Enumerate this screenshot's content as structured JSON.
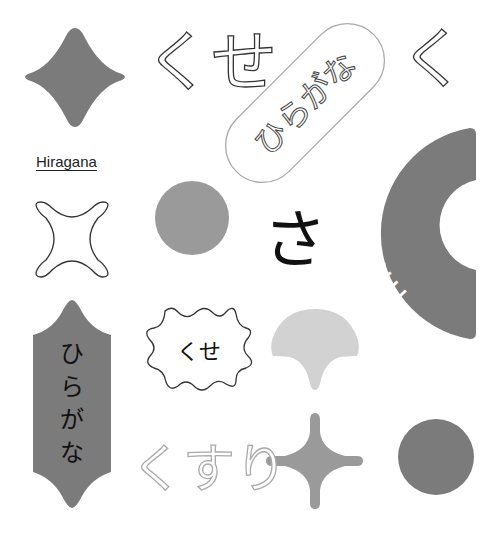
{
  "colors": {
    "background": "#ffffff",
    "dark_gray": "#7b7b7b",
    "mid_gray": "#9a9a9a",
    "light_gray": "#d2d2d2",
    "outline": "#333333",
    "light_outline": "#aaaaaa",
    "text_dark": "#111111",
    "text_white": "#ffffff"
  },
  "items": {
    "diamond_star": {
      "icon": "four-point-star-icon"
    },
    "kuse_outline_top": {
      "text": "くせ"
    },
    "pill_badge": {
      "text": "ひらがな"
    },
    "ku_outline": {
      "text": "く"
    },
    "hiragana_link": {
      "text": "Hiragana"
    },
    "arc_badge": {
      "text": "HIRAGANA"
    },
    "x_outline": {
      "icon": "x-star-outline-icon"
    },
    "gray_circle": {
      "icon": "circle-icon"
    },
    "sa_char": {
      "text": "さ"
    },
    "vertical_tag": {
      "text": "ひらがな",
      "chars": [
        "ひ",
        "ら",
        "が",
        "な"
      ]
    },
    "kuse_burst": {
      "text": "くせ"
    },
    "ginkgo_leaf": {
      "icon": "ginkgo-leaf-icon"
    },
    "kusuri_outline": {
      "text": "くすり"
    },
    "plus_star": {
      "icon": "plus-star-icon"
    },
    "dark_circle": {
      "icon": "circle-icon"
    }
  }
}
